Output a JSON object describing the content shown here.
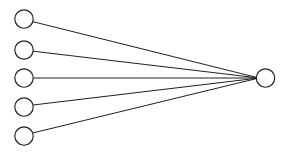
{
  "diagram": {
    "type": "node-link",
    "canvas": {
      "width": 292,
      "height": 159,
      "background": "#ffffff"
    },
    "style": {
      "node_fill": "#ffffff",
      "node_stroke": "#231f20",
      "node_stroke_width": 1.15,
      "edge_stroke": "#231f20",
      "edge_stroke_width": 1
    },
    "input_nodes": [
      {
        "id": "input-1",
        "label": "",
        "cx": 24,
        "cy": 19,
        "r": 9.2
      },
      {
        "id": "input-2",
        "label": "",
        "cx": 24,
        "cy": 50,
        "r": 9.2
      },
      {
        "id": "input-3",
        "label": "",
        "cx": 24,
        "cy": 78,
        "r": 9.2
      },
      {
        "id": "input-4",
        "label": "",
        "cx": 24,
        "cy": 107,
        "r": 9.2
      },
      {
        "id": "input-5",
        "label": "",
        "cx": 24,
        "cy": 136,
        "r": 9.2
      }
    ],
    "output_node": {
      "id": "output-1",
      "label": "",
      "cx": 265.5,
      "cy": 78,
      "r": 9.2
    },
    "converge_point": {
      "x": 256.5,
      "y": 78
    },
    "edges": [
      {
        "id": "edge-1",
        "from": "input-1",
        "to": "output-1",
        "x1": 32.6,
        "y1": 21.6,
        "x2": 256.5,
        "y2": 77.4
      },
      {
        "id": "edge-2",
        "from": "input-2",
        "to": "output-1",
        "x1": 33.0,
        "y1": 51.2,
        "x2": 256.5,
        "y2": 77.7
      },
      {
        "id": "edge-3",
        "from": "input-3",
        "to": "output-1",
        "x1": 33.2,
        "y1": 78.0,
        "x2": 256.5,
        "y2": 78.0
      },
      {
        "id": "edge-4",
        "from": "input-4",
        "to": "output-1",
        "x1": 33.0,
        "y1": 105.0,
        "x2": 256.5,
        "y2": 78.3
      },
      {
        "id": "edge-5",
        "from": "input-5",
        "to": "output-1",
        "x1": 32.6,
        "y1": 133.0,
        "x2": 256.5,
        "y2": 78.6
      }
    ]
  }
}
